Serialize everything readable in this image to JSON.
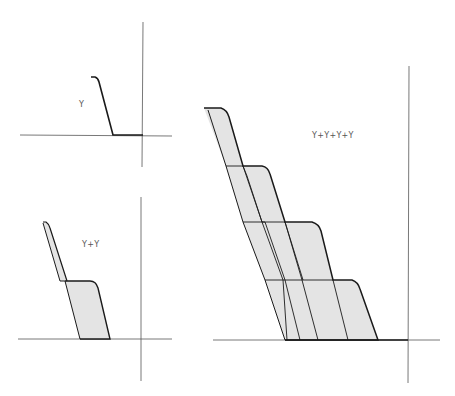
{
  "panels": [
    {
      "id": "single",
      "label": "Y"
    },
    {
      "id": "double",
      "label": "Y+Y"
    },
    {
      "id": "quadruple",
      "label": "Y+Y+Y+Y"
    }
  ],
  "colors": {
    "line": "#1a1a1a",
    "axis": "#666666",
    "fill": "#e4e4e4",
    "background": "#ffffff"
  }
}
